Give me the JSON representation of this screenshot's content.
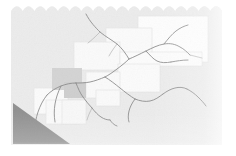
{
  "image": {
    "kind": "map-thumbnail",
    "width": 236,
    "height": 156,
    "alt_text": "Faded grayscale map thumbnail with road network, tiled map panels and a shaded triangular region",
    "caption": ""
  },
  "palette": {
    "page_background": "#ffffff",
    "map_paper": "#ececec",
    "map_paper_light": "#f4f4f4",
    "tile_white": "#fdfdfd",
    "tile_fill": "#f7f7f7",
    "tile_edge": "#e4e4e4",
    "highlight_cell": "#d6d6d6",
    "highlight_cell_2": "#d0d0d0",
    "shaded_region": "#919191",
    "shaded_region_edge": "#8a8a8a",
    "network_line": "#8d8d8d",
    "network_line_soft": "#a5a5a5"
  },
  "canvas": {
    "label": "map-canvas",
    "left": 11,
    "top": 5,
    "right": 222,
    "bottom": 145,
    "scallop_count": 18,
    "scallop_radius": 6
  },
  "layers": [
    {
      "name": "basemap",
      "label": "Base map paper",
      "opacity": 1
    },
    {
      "name": "tiles",
      "label": "Map tile panels",
      "opacity": 1
    },
    {
      "name": "highlight",
      "label": "Selected grid cell",
      "opacity": 1
    },
    {
      "name": "network",
      "label": "Road and river network",
      "opacity": 1
    },
    {
      "name": "region",
      "label": "Shaded triangular region",
      "opacity": 1
    }
  ],
  "tiles": [
    {
      "id": "tile-1",
      "x": 138,
      "y": 16,
      "w": 70,
      "h": 46,
      "fill": "#fdfdfd"
    },
    {
      "id": "tile-2",
      "x": 106,
      "y": 28,
      "w": 46,
      "h": 30,
      "fill": "#fbfbfb"
    },
    {
      "id": "tile-3",
      "x": 74,
      "y": 42,
      "w": 46,
      "h": 28,
      "fill": "#fafafa"
    },
    {
      "id": "tile-4",
      "x": 120,
      "y": 52,
      "w": 82,
      "h": 14,
      "fill": "#fcfcfc"
    },
    {
      "id": "tile-5",
      "x": 118,
      "y": 64,
      "w": 42,
      "h": 28,
      "fill": "#fbfbfb"
    },
    {
      "id": "tile-6",
      "x": 86,
      "y": 72,
      "w": 34,
      "h": 26,
      "fill": "#fafafa"
    },
    {
      "id": "tile-7",
      "x": 34,
      "y": 88,
      "w": 34,
      "h": 26,
      "fill": "#fbfbfb"
    },
    {
      "id": "tile-8",
      "x": 46,
      "y": 100,
      "w": 34,
      "h": 24,
      "fill": "#fafafa"
    },
    {
      "id": "tile-9",
      "x": 62,
      "y": 100,
      "w": 24,
      "h": 24,
      "fill": "#f8f8f8"
    },
    {
      "id": "tile-10",
      "x": 96,
      "y": 90,
      "w": 24,
      "h": 16,
      "fill": "#fafafa"
    }
  ],
  "highlight_cells": [
    {
      "id": "cell-a",
      "x": 52,
      "y": 68,
      "w": 30,
      "h": 22,
      "fill": "#d4d4d4"
    },
    {
      "id": "cell-b",
      "x": 64,
      "y": 82,
      "w": 22,
      "h": 16,
      "fill": "#cfcfcf"
    }
  ],
  "shaded_region": {
    "id": "region-triangle",
    "label": "Shaded triangular area",
    "points": "13,103 13,144 70,144",
    "fill": "#919191"
  },
  "network": {
    "label": "Road and river network",
    "stroke": "#8d8d8d",
    "stroke_width": 0.9,
    "paths": [
      "M86,14 C90,22 96,28 100,32 C106,37 112,40 117,44 C122,48 126,54 129,59",
      "M129,59 C134,57 140,54 146,51 C152,48 158,45 164,44 C170,43 175,44 180,47 C184,49 187,52 190,55",
      "M164,44 C168,39 172,34 176,31 C180,28 184,26 188,25",
      "M146,51 C150,55 153,59 157,61 C161,63 166,63 171,62",
      "M171,62 C177,61 182,60 188,60",
      "M129,59 C125,63 121,66 117,69 C113,72 109,75 105,77",
      "M105,77 C100,79 95,81 90,82 C85,83 80,83 76,83",
      "M76,83 C71,83 66,84 61,86 C56,88 51,91 47,95",
      "M47,95 C43,100 40,106 38,112 C36,118 35,124 34,130",
      "M76,83 C78,88 80,93 83,97 C86,101 89,105 92,108",
      "M92,108 C95,112 98,115 101,117 C104,119 107,120 110,120",
      "M105,77 C110,80 115,84 120,88 C125,92 130,96 135,99",
      "M135,99 C140,101 145,102 150,101 C155,100 159,97 163,94",
      "M163,94 C167,91 171,89 175,88 C179,87 183,87 187,89",
      "M187,89 C191,91 195,94 198,97 C201,100 204,103 206,106",
      "M135,99 C132,103 130,107 129,111 C128,115 128,119 129,122",
      "M110,120 C112,123 114,125 117,126",
      "M61,86 C58,92 56,98 55,104 C54,110 54,116 55,122",
      "M34,130 C34,134 35,138 36,141"
    ]
  },
  "network_soft": {
    "label": "Secondary network traces",
    "stroke": "#b3b3b3",
    "stroke_width": 0.7,
    "paths": [
      "M100,32 C96,36 92,40 88,43",
      "M117,44 C114,48 111,52 109,56",
      "M190,55 C194,56 198,57 202,58",
      "M92,108 C90,112 88,116 87,120"
    ]
  },
  "texture": {
    "label": "Paper grain",
    "enabled": true,
    "opacity": 0.35
  }
}
